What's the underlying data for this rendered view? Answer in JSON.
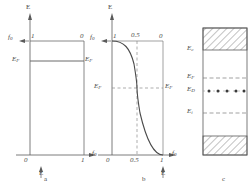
{
  "figure": {
    "panels": [
      {
        "id": "a",
        "letter": "a",
        "caption_letter": "a",
        "vertical_axis_label": "E",
        "horizontal_axis_label": "f",
        "horizontal_axis_sub": "0",
        "curve_type": "step",
        "description": "Fermi-Dirac distribution at T = 0 K, a sharp step at E_F",
        "tick_labels": [
          "0",
          "1"
        ],
        "value_top": "1",
        "value_right": "0",
        "fermi_label": "E",
        "fermi_sub": "F",
        "fermi_label_right": "E",
        "fermi_sub_right": "F",
        "f0_label": "f",
        "f0_sub": "0"
      },
      {
        "id": "b",
        "letter": "b",
        "caption_letter": "b",
        "vertical_axis_label": "E",
        "horizontal_axis_label": "f",
        "horizontal_axis_sub": "0",
        "curve_type": "fermi-dirac",
        "description": "Fermi-Dirac distribution at T > 0 K, smooth sigmoid through f=0.5 at E_F",
        "tick_labels": [
          "0",
          "0.5",
          "1"
        ],
        "value_top": "1",
        "value_mid": "0.5",
        "value_right": "0",
        "fermi_label": "E",
        "fermi_sub": "F",
        "fermi_label_right": "E",
        "fermi_sub_right": "F",
        "f0_label": "f",
        "f0_sub": "0"
      },
      {
        "id": "c",
        "letter": "c",
        "caption_letter": "c",
        "description": "Semiconductor band diagram with donor level",
        "levels": [
          {
            "name": "E",
            "sub": "c",
            "style": "solid",
            "kind": "conduction-band-edge"
          },
          {
            "name": "E",
            "sub": "F",
            "style": "dashed",
            "kind": "fermi-level"
          },
          {
            "name": "E",
            "sub": "D",
            "style": "dotted",
            "kind": "donor-level"
          },
          {
            "name": "E",
            "sub": "i",
            "style": "dashed",
            "kind": "intrinsic-level"
          }
        ],
        "donor_dot_count": 5,
        "bands": [
          "conduction-band-hatched",
          "valence-band-hatched"
        ]
      }
    ],
    "colors": {
      "line": "#5a5a5a",
      "text": "#4a4a4a",
      "dash": "#7a7a7a",
      "background": "#ffffff"
    }
  }
}
